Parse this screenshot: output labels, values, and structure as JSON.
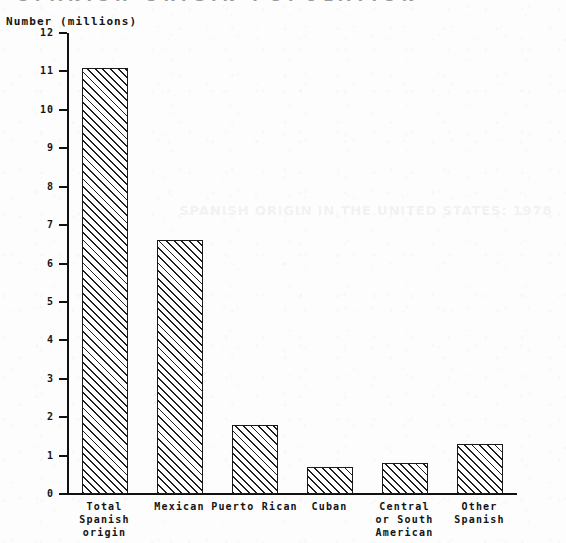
{
  "page": {
    "cutoff_top_text": "SPANISH ORIGIN POPULATION",
    "bleed_through_text": "SPANISH ORIGIN IN THE UNITED STATES: 1978"
  },
  "chart_data": {
    "type": "bar",
    "title": "",
    "subtitle": "",
    "xlabel": "",
    "ylabel": "Number (millions)",
    "ylim": [
      0,
      12
    ],
    "ytick_step": 1,
    "grid": false,
    "legend": "none",
    "bar_style": {
      "fill": "#ffffff",
      "edge": "#1a1a1a",
      "hatch": "forward-diagonal"
    },
    "categories": [
      "Total\nSpanish\norigin",
      "Mexican",
      "Puerto Rican",
      "Cuban",
      "Central\nor South\nAmerican",
      "Other\nSpanish"
    ],
    "values": [
      11.1,
      6.6,
      1.8,
      0.7,
      0.8,
      1.3
    ],
    "ytick_labels": [
      "0",
      "1",
      "2",
      "3",
      "4",
      "5",
      "6",
      "7",
      "8",
      "9",
      "10",
      "11",
      "12"
    ]
  }
}
